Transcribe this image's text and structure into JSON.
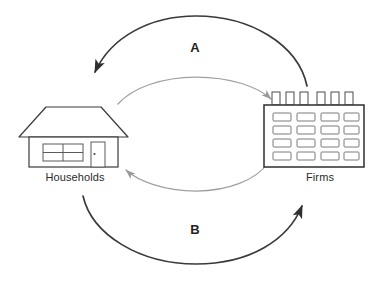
{
  "diagram": {
    "background_color": "#ffffff",
    "nodes": [
      {
        "id": "households",
        "label": "Households",
        "icon": "house-icon",
        "position": "left"
      },
      {
        "id": "firms",
        "label": "Firms",
        "icon": "factory-icon",
        "position": "right"
      }
    ],
    "flows": [
      {
        "id": "a",
        "label": "A",
        "from": "firms",
        "to": "households",
        "path": "outer-upper-arc",
        "color": "#3a3a3a",
        "style": "thick-dark"
      },
      {
        "id": "inner-upper",
        "label": "",
        "from": "households",
        "to": "firms",
        "path": "inner-upper-arc",
        "color": "#9a9a9a",
        "style": "thin-gray"
      },
      {
        "id": "inner-lower",
        "label": "",
        "from": "firms",
        "to": "households",
        "path": "inner-lower-arc",
        "color": "#9a9a9a",
        "style": "thin-gray"
      },
      {
        "id": "b",
        "label": "B",
        "from": "households",
        "to": "firms",
        "path": "outer-lower-arc",
        "color": "#3a3a3a",
        "style": "thick-dark"
      }
    ],
    "house": {
      "name": "house-icon",
      "outline_color": "#3a3a3a",
      "window_panes": 4,
      "door_knob": true
    },
    "factory": {
      "name": "factory-icon",
      "outline_color": "#3a3a3a",
      "chimneys": 6,
      "window_rows": 4,
      "window_columns": 4
    }
  }
}
